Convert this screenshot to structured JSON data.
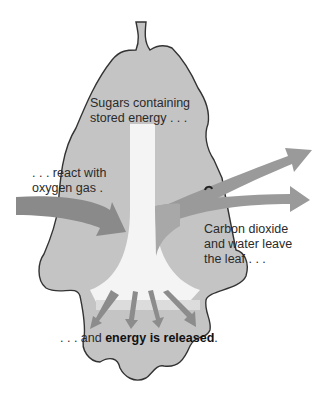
{
  "diagram": {
    "colors": {
      "leaf_fill": "#c4c4c4",
      "leaf_outline": "#333333",
      "sugar_column": "#f4f4f4",
      "oxygen_arrow": "#8a8a8a",
      "exhaust_arrows": "#9a9a9a",
      "energy_arrows": "#8c8c8c"
    },
    "labels": {
      "sugars_line1": "Sugars containing",
      "sugars_line2": "stored energy . . .",
      "oxygen_line1": ". . . react with",
      "oxygen_line2": "oxygen gas .",
      "co2_line1": "Carbon dioxide",
      "co2_line2": "and water leave",
      "co2_line3": "the leaf . . .",
      "energy_prefix": ". . . and ",
      "energy_bold": "energy is released",
      "energy_suffix": "."
    }
  }
}
